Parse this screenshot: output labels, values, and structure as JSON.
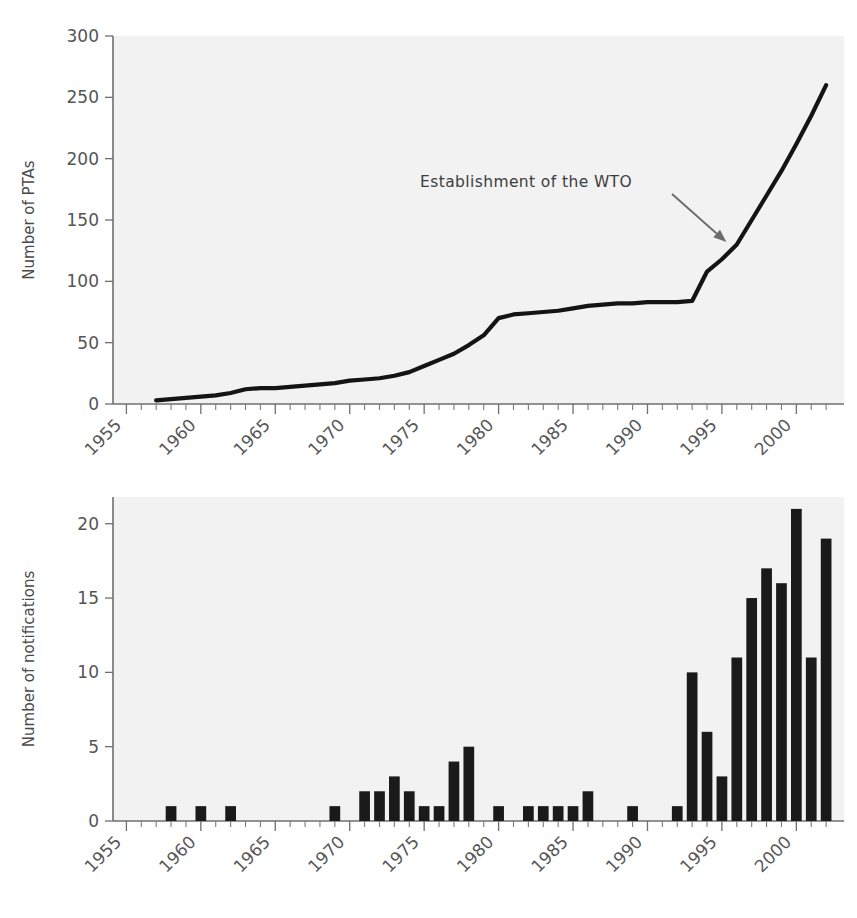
{
  "figure": {
    "background_color": "#ffffff",
    "plot_background_color": "#f2f2f2",
    "line_color": "#141414",
    "bar_color": "#1a1a1a",
    "axis_color": "#6f6f6f",
    "annotation_color": "#6b6b6b"
  },
  "chart_data": [
    {
      "type": "line",
      "title": "",
      "xlabel": "",
      "ylabel": "Number of PTAs",
      "xlim": [
        1955,
        2002
      ],
      "ylim": [
        0,
        300
      ],
      "ytick_labels": [
        "0",
        "50",
        "100",
        "150",
        "200",
        "250",
        "300"
      ],
      "yticks": [
        0,
        50,
        100,
        150,
        200,
        250,
        300
      ],
      "xtick_labels": [
        "1955",
        "1960",
        "1965",
        "1970",
        "1975",
        "1980",
        "1985",
        "1990",
        "1995",
        "2000"
      ],
      "xticks": [
        1955,
        1960,
        1965,
        1970,
        1975,
        1980,
        1985,
        1990,
        1995,
        2000
      ],
      "minor_tick_interval": 1,
      "grid": false,
      "legend": "none",
      "x": [
        1957,
        1958,
        1959,
        1960,
        1961,
        1962,
        1963,
        1964,
        1965,
        1966,
        1967,
        1968,
        1969,
        1970,
        1971,
        1972,
        1973,
        1974,
        1975,
        1976,
        1977,
        1978,
        1979,
        1980,
        1981,
        1982,
        1983,
        1984,
        1985,
        1986,
        1987,
        1988,
        1989,
        1990,
        1991,
        1992,
        1993,
        1994,
        1995,
        1996,
        1997,
        1998,
        1999,
        2000,
        2001,
        2002
      ],
      "values": [
        3,
        4,
        5,
        6,
        7,
        9,
        12,
        13,
        13,
        14,
        15,
        16,
        17,
        19,
        20,
        21,
        23,
        26,
        31,
        36,
        41,
        48,
        56,
        70,
        73,
        74,
        75,
        76,
        78,
        80,
        81,
        82,
        82,
        83,
        83,
        83,
        84,
        108,
        118,
        130,
        150,
        170,
        190,
        212,
        235,
        260
      ],
      "annotations": [
        {
          "text": "Establishment of the WTO",
          "text_x": 1983.5,
          "text_y": 178,
          "points_to_x": 1995.3,
          "points_to_y": 132
        }
      ]
    },
    {
      "type": "bar",
      "title": "",
      "xlabel": "",
      "ylabel": "Number of notifications",
      "xlim": [
        1955,
        2002
      ],
      "ylim": [
        0,
        21.8
      ],
      "ytick_labels": [
        "0",
        "5",
        "10",
        "15",
        "20"
      ],
      "yticks": [
        0,
        5,
        10,
        15,
        20
      ],
      "xtick_labels": [
        "1955",
        "1960",
        "1965",
        "1970",
        "1975",
        "1980",
        "1985",
        "1990",
        "1995",
        "2000"
      ],
      "xticks": [
        1955,
        1960,
        1965,
        1970,
        1975,
        1980,
        1985,
        1990,
        1995,
        2000
      ],
      "minor_tick_interval": 1,
      "grid": false,
      "legend": "none",
      "categories": [
        1955,
        1956,
        1957,
        1958,
        1959,
        1960,
        1961,
        1962,
        1963,
        1964,
        1965,
        1966,
        1967,
        1968,
        1969,
        1970,
        1971,
        1972,
        1973,
        1974,
        1975,
        1976,
        1977,
        1978,
        1979,
        1980,
        1981,
        1982,
        1983,
        1984,
        1985,
        1986,
        1987,
        1988,
        1989,
        1990,
        1991,
        1992,
        1993,
        1994,
        1995,
        1996,
        1997,
        1998,
        1999,
        2000,
        2001,
        2002
      ],
      "values": [
        0,
        0,
        0,
        1,
        0,
        1,
        0,
        1,
        0,
        0,
        0,
        0,
        0,
        0,
        1,
        0,
        2,
        2,
        3,
        2,
        1,
        1,
        4,
        5,
        0,
        1,
        0,
        1,
        1,
        1,
        1,
        2,
        0,
        0,
        1,
        0,
        0,
        1,
        10,
        6,
        3,
        11,
        15,
        17,
        16,
        21,
        11,
        19
      ]
    }
  ]
}
